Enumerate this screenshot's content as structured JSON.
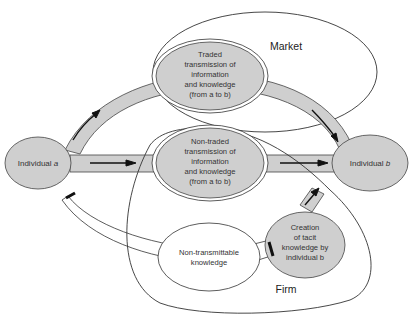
{
  "colors": {
    "fill": "#cfcfcf",
    "stroke": "#333333",
    "arrow": "#111111",
    "background": "#ffffff",
    "plain_node": "#ffffff"
  },
  "regions": {
    "market": {
      "label": "Market"
    },
    "firm": {
      "label": "Firm"
    }
  },
  "nodes": {
    "individual_a": {
      "lines": [
        "Individual a"
      ],
      "italic_suffix": "a",
      "prefix": "Individual "
    },
    "individual_b": {
      "lines": [
        "Individual b"
      ],
      "italic_suffix": "b",
      "prefix": "Individual "
    },
    "traded": {
      "lines": [
        "Traded",
        "transmission of",
        "information",
        "and knowledge",
        "(from a to b)"
      ]
    },
    "non_traded": {
      "lines": [
        "Non-traded",
        "transmission of",
        "information",
        "and knowledge",
        "(from a to b)"
      ]
    },
    "non_transmittable": {
      "lines": [
        "Non-transmittable",
        "knowledge"
      ]
    },
    "tacit_creation": {
      "lines": [
        "Creation",
        "of tacit",
        "knowledge by",
        "individual b"
      ]
    }
  },
  "edges": [
    {
      "from": "individual_a",
      "to": "traded",
      "arrow": true
    },
    {
      "from": "traded",
      "to": "individual_b",
      "arrow": true
    },
    {
      "from": "individual_a",
      "to": "non_traded",
      "arrow": true
    },
    {
      "from": "non_traded",
      "to": "individual_b",
      "arrow": true
    },
    {
      "from": "individual_a",
      "to": "non_transmittable",
      "arrow": false,
      "blocked": true
    },
    {
      "from": "non_transmittable",
      "to": "tacit_creation",
      "arrow": false,
      "blocked": true
    },
    {
      "from": "tacit_creation",
      "to": "individual_b",
      "arrow": true
    }
  ]
}
